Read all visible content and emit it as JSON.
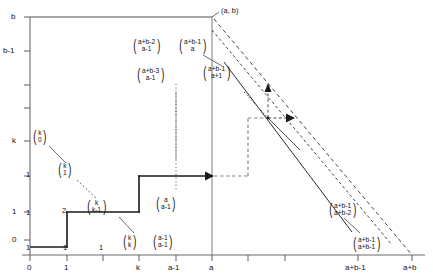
{
  "figure": {
    "type": "lattice-path-diagram",
    "axes": {
      "x_label": "",
      "y_label": "",
      "x_ticks": [
        {
          "label": "0",
          "x": 0
        },
        {
          "label": "1",
          "x": 1
        },
        {
          "label": "",
          "x": 2
        },
        {
          "label": "k",
          "x": 3
        },
        {
          "label": "a-1",
          "x": 4
        },
        {
          "label": "a",
          "x": 5
        },
        {
          "label": "",
          "x": 6
        },
        {
          "label": "",
          "x": 7
        },
        {
          "label": "a+b-1",
          "x": 8
        },
        {
          "label": "a+b",
          "x": 9
        }
      ],
      "y_ticks": [
        {
          "label": "0",
          "y": 0
        },
        {
          "label": "1",
          "y": 1
        },
        {
          "label": "",
          "y": 2
        },
        {
          "label": "k",
          "y": 3
        },
        {
          "label": "",
          "y": 4
        },
        {
          "label": "",
          "y": 5
        },
        {
          "label": "b-1",
          "y": 6
        },
        {
          "label": "b",
          "y": 7
        }
      ]
    },
    "corner_label": "(a, b)",
    "plain_numbers": [
      {
        "text": "1",
        "x": 26,
        "y": 174
      },
      {
        "text": "1",
        "x": 26,
        "y": 212
      },
      {
        "text": "1",
        "x": 26,
        "y": 247
      },
      {
        "text": "1",
        "x": 62,
        "y": 247
      },
      {
        "text": "2",
        "x": 62,
        "y": 212
      },
      {
        "text": "1",
        "x": 99,
        "y": 247
      }
    ],
    "binomials": [
      {
        "name": "k-choose-0",
        "top": "k",
        "bottom": "0",
        "x": 32,
        "y": 134
      },
      {
        "name": "k-choose-1",
        "top": "k",
        "bottom": "1",
        "x": 55,
        "y": 166
      },
      {
        "name": "k-choose-k-1",
        "top": "k",
        "bottom": "k-1",
        "x": 84,
        "y": 202
      },
      {
        "name": "k-choose-k",
        "top": "k",
        "bottom": "k",
        "x": 119,
        "y": 238
      },
      {
        "name": "a-1-choose-a-1",
        "top": "a-1",
        "bottom": "a-1",
        "x": 149,
        "y": 238
      },
      {
        "name": "a-choose-a-1",
        "top": "a",
        "bottom": "a-1",
        "x": 150,
        "y": 200
      },
      {
        "name": "a-plus-b-3-choose-a-1",
        "top": "a+b-3",
        "bottom": "a-1",
        "x": 132,
        "y": 70
      },
      {
        "name": "a-plus-b-2-choose-a-1",
        "top": "a+b-2",
        "bottom": "a-1",
        "x": 130,
        "y": 40
      },
      {
        "name": "a-plus-b-1-choose-a",
        "top": "a+b-1",
        "bottom": "a",
        "x": 176,
        "y": 40
      },
      {
        "name": "a-plus-b-1-choose-a+1",
        "top": "a+b-1",
        "bottom": "a+1",
        "x": 200,
        "y": 67
      },
      {
        "name": "a-plus-b-1-choose-a+b-2",
        "top": "a+b-1",
        "bottom": "a+b-2",
        "x": 330,
        "y": 205
      },
      {
        "name": "a-plus-b-1-choose-a+b-1",
        "top": "a+b-1",
        "bottom": "a+b-1",
        "x": 352,
        "y": 240
      }
    ],
    "colors": {
      "line": "#1a1a1a",
      "axis": "#6b6b6b",
      "background": "#ffffff"
    }
  }
}
